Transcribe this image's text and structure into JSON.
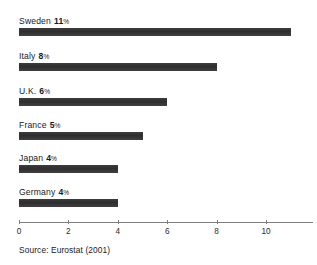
{
  "chart_data": {
    "type": "bar",
    "orientation": "horizontal",
    "title": "",
    "subtitle": "",
    "xlabel": "",
    "ylabel": "",
    "categories": [
      "Sweden",
      "Italy",
      "U.K.",
      "France",
      "Japan",
      "Germany"
    ],
    "values": [
      11,
      8,
      6,
      5,
      4,
      4
    ],
    "value_labels": [
      "11",
      "8",
      "6",
      "5",
      "4",
      "4"
    ],
    "unit": "%",
    "xlim": [
      0,
      11.9
    ],
    "xticks": [
      0,
      2,
      4,
      6,
      8,
      10
    ],
    "xtick_labels": [
      "0",
      "2",
      "4",
      "6",
      "8",
      "10"
    ],
    "grid": false,
    "legend": null,
    "bar_color": "#333333",
    "axis_color": "#7d7d7d",
    "annotations": []
  },
  "footer": {
    "source": "Source: Eurostat (2001)"
  }
}
